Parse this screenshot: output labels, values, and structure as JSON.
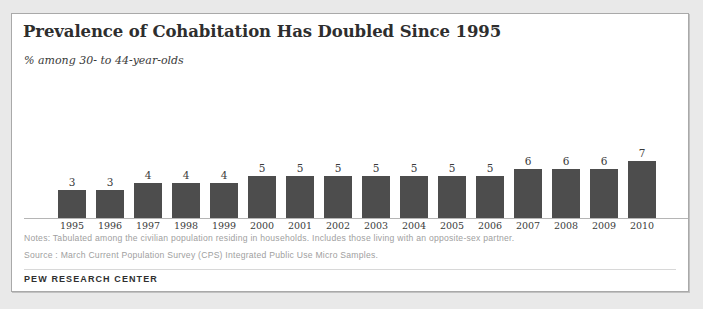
{
  "card": {
    "title": "Prevalence of Cohabitation Has Doubled Since 1995",
    "subtitle": "% among 30- to 44-year-olds",
    "notes": "Notes: Tabulated among the civilian population residing in households. Includes those living with an opposite-sex partner.",
    "source": "Source : March Current Population Survey (CPS) Integrated Public Use Micro Samples.",
    "footer": "PEW RESEARCH CENTER"
  },
  "colors": {
    "bar": "#4d4d4d",
    "title": "#2e2e2e",
    "note": "#a0a0a0",
    "axis": "#b5b5b5",
    "card_background": "#ffffff",
    "page_background": "#e9e9e9"
  },
  "chart_data": {
    "type": "bar",
    "title": "Prevalence of Cohabitation Has Doubled Since 1995",
    "subtitle": "% among 30- to 44-year-olds",
    "xlabel": "",
    "ylabel": "% among 30- to 44-year-olds",
    "categories": [
      "1995",
      "1996",
      "1997",
      "1998",
      "1999",
      "2000",
      "2001",
      "2002",
      "2003",
      "2004",
      "2005",
      "2006",
      "2007",
      "2008",
      "2009",
      "2010"
    ],
    "values": [
      3,
      3,
      4,
      4,
      4,
      5,
      5,
      5,
      5,
      5,
      5,
      5,
      6,
      6,
      6,
      7
    ],
    "value_labels": [
      "3",
      "3",
      "4",
      "4",
      "4",
      "5",
      "5",
      "5",
      "5",
      "5",
      "5",
      "5",
      "6",
      "6",
      "6",
      "7"
    ],
    "ylim": [
      0,
      7
    ],
    "grid": false,
    "legend": null,
    "axis_visible": "x-baseline-only"
  }
}
